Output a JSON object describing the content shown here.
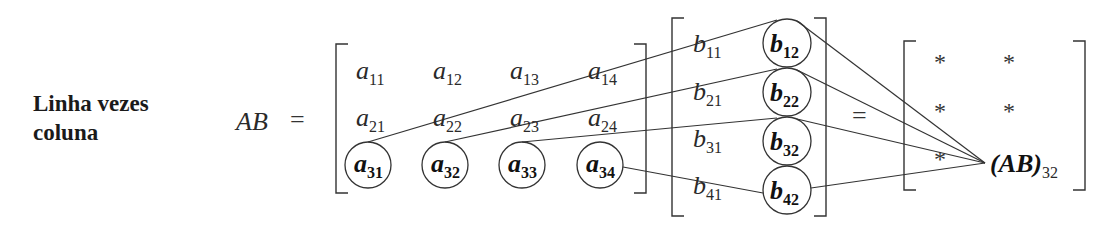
{
  "title_lines": [
    "Linha vezes",
    "coluna"
  ],
  "lhs": "AB",
  "equals": "=",
  "matrix_a": {
    "symbol": "a",
    "rows": [
      [
        "11",
        "12",
        "13",
        "14"
      ],
      [
        "21",
        "22",
        "23",
        "24"
      ],
      [
        "31",
        "32",
        "33",
        "34"
      ]
    ],
    "highlighted_row": 3
  },
  "matrix_b": {
    "symbol": "b",
    "rows": [
      [
        "11",
        "12"
      ],
      [
        "21",
        "22"
      ],
      [
        "31",
        "32"
      ],
      [
        "41",
        "42"
      ]
    ],
    "highlighted_column": 2
  },
  "result": {
    "star": "*",
    "rows": [
      [
        "*",
        "*"
      ],
      [
        "*",
        "*"
      ],
      [
        "*",
        "(AB)32"
      ]
    ],
    "highlight_label": "(AB)",
    "highlight_sub": "32"
  }
}
